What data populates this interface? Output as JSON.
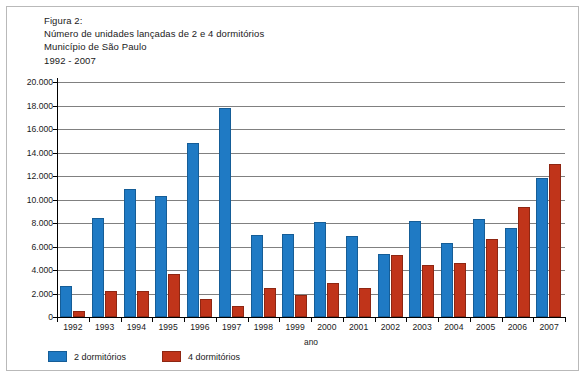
{
  "figure": {
    "label": "Figura 2:",
    "line2": "Número de unidades lançadas de 2 e 4 dormitórios",
    "line3": "Município de São Paulo",
    "line4": "1992 - 2007"
  },
  "colors": {
    "series_2_dorm": "#1f7ac4",
    "series_4_dorm": "#c0341a",
    "gridline": "#808080",
    "axis": "#000000",
    "frame_border": "#b9b9b9"
  },
  "chart_data": {
    "type": "bar",
    "title": "Número de unidades lançadas de 2 e 4 dormitórios",
    "subtitle": "Município de São Paulo 1992 - 2007",
    "xlabel": "ano",
    "ylabel": "",
    "ylim": [
      0,
      20000
    ],
    "ytick_labels": [
      "20.000",
      "18.000",
      "16.000",
      "14.000",
      "12.000",
      "10.000",
      "8.000",
      "6.000",
      "4.000",
      "2.000",
      "0"
    ],
    "ytick_values": [
      20000,
      18000,
      16000,
      14000,
      12000,
      10000,
      8000,
      6000,
      4000,
      2000,
      0
    ],
    "grid": true,
    "legend_position": "bottom-left",
    "categories": [
      "1992",
      "1993",
      "1994",
      "1995",
      "1996",
      "1997",
      "1998",
      "1999",
      "2000",
      "2001",
      "2002",
      "2003",
      "2004",
      "2005",
      "2006",
      "2007"
    ],
    "series": [
      {
        "name": "2 dormitórios",
        "color": "#1f7ac4",
        "values": [
          2600,
          8400,
          10900,
          10300,
          14800,
          17800,
          7000,
          7100,
          8050,
          6900,
          5400,
          8150,
          6300,
          8300,
          7600,
          11800
        ]
      },
      {
        "name": "4 dormitórios",
        "color": "#c0341a",
        "values": [
          550,
          2200,
          2250,
          3700,
          1550,
          950,
          2450,
          1900,
          2900,
          2500,
          5300,
          4450,
          4600,
          6600,
          9400,
          13000
        ]
      }
    ]
  }
}
